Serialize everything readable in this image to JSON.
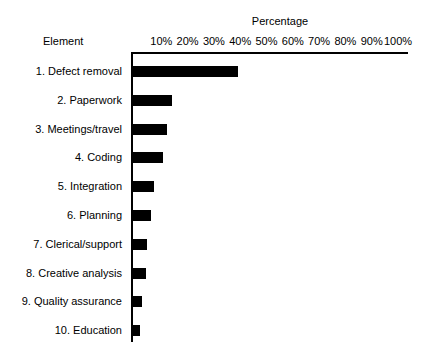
{
  "chart_data": {
    "type": "bar",
    "orientation": "horizontal",
    "title": "",
    "xlabel": "Percentage",
    "ylabel": "Element",
    "xlim": [
      0,
      100
    ],
    "grid": false,
    "legend": null,
    "xticks": [
      "10%",
      "20%",
      "30%",
      "40%",
      "50%",
      "60%",
      "70%",
      "80%",
      "90%",
      "100%"
    ],
    "xtick_values": [
      10,
      20,
      30,
      40,
      50,
      60,
      70,
      80,
      90,
      100
    ],
    "categories": [
      "1. Defect removal",
      "2. Paperwork",
      "3. Meetings/travel",
      "4. Coding",
      "5. Integration",
      "6. Planning",
      "7. Clerical/support",
      "8. Creative analysis",
      "9. Quality assurance",
      "10. Education"
    ],
    "values": [
      40,
      15,
      13,
      11.5,
      8,
      7,
      5.5,
      5,
      3.5,
      2.5
    ],
    "bar_color": "#000000"
  },
  "style": {
    "axis_color": "#000000",
    "background": "#ffffff",
    "text_color": "#000000"
  }
}
